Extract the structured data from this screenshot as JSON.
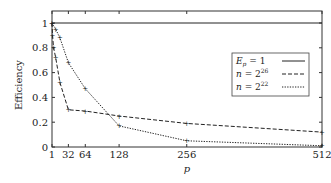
{
  "chart_data": {
    "type": "line",
    "title": "",
    "xlabel": "p",
    "ylabel": "Efficiency",
    "xlim": [
      1,
      512
    ],
    "ylim": [
      0,
      1.1
    ],
    "xticks": [
      1,
      32,
      64,
      128,
      256,
      512
    ],
    "xtick_labels": [
      "1",
      "32",
      "64",
      "128",
      "256",
      "512"
    ],
    "yticks": [
      0,
      0.2,
      0.4,
      0.6,
      0.8,
      1
    ],
    "ytick_labels": [
      "0",
      "0.2",
      "0.4",
      "0.6",
      "0.8",
      "1"
    ],
    "legend_position": "right",
    "series": [
      {
        "name": "E_p = 1",
        "style": "solid",
        "x": [
          1,
          512
        ],
        "y": [
          1,
          1
        ]
      },
      {
        "name": "n = 2^26",
        "style": "dashed",
        "x": [
          1,
          2,
          4,
          8,
          16,
          32,
          64,
          128,
          256,
          512
        ],
        "y": [
          1,
          0.9,
          0.8,
          0.72,
          0.52,
          0.3,
          0.29,
          0.25,
          0.19,
          0.12
        ]
      },
      {
        "name": "n = 2^22",
        "style": "dotted",
        "x": [
          1,
          8,
          16,
          32,
          64,
          128,
          256,
          512
        ],
        "y": [
          1,
          0.95,
          0.88,
          0.68,
          0.47,
          0.17,
          0.05,
          0.01
        ]
      }
    ],
    "legend": [
      {
        "base": "E",
        "sub": "p",
        "rest": "= 1"
      },
      {
        "base": "n",
        "rest": "= 2",
        "sup": "26"
      },
      {
        "base": "n",
        "rest": "= 2",
        "sup": "22"
      }
    ]
  }
}
